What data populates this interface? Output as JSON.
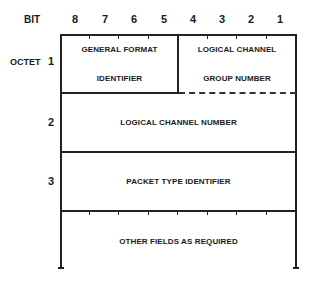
{
  "header": {
    "bit_label": "BIT",
    "bits": [
      "8",
      "7",
      "6",
      "5",
      "4",
      "3",
      "2",
      "1"
    ]
  },
  "octets": {
    "octet_label": "OCTET",
    "rows": [
      {
        "number": "1"
      },
      {
        "number": "2"
      },
      {
        "number": "3"
      }
    ]
  },
  "fields": {
    "gfi_line1": "GENERAL FORMAT",
    "gfi_line2": "IDENTIFIER",
    "lcgn_line1": "LOGICAL CHANNEL",
    "lcgn_line2": "GROUP NUMBER",
    "lcn": "LOGICAL CHANNEL NUMBER",
    "pti": "PACKET TYPE IDENTIFIER",
    "other": "OTHER FIELDS AS REQUIRED"
  }
}
